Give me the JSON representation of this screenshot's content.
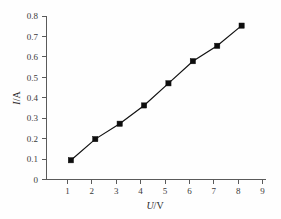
{
  "figure": {
    "background_color": "#fefefe",
    "axis_color": "#5a5a5a",
    "series_color": "#0d0d0d"
  },
  "axes": {
    "x_title_italic": "U",
    "x_title_rest": "/V",
    "y_title_italic": "I",
    "y_title_rest": "/A",
    "x_ticks": [
      "1",
      "2",
      "3",
      "4",
      "5",
      "6",
      "7",
      "8",
      "9"
    ],
    "y_ticks": [
      "0",
      "0.1",
      "0.2",
      "0.3",
      "0.4",
      "0.5",
      "0.6",
      "0.7",
      "0.8"
    ]
  },
  "chart_data": {
    "type": "scatter",
    "title": "",
    "subtitle": "",
    "xlabel": "U/V",
    "ylabel": "I/A",
    "xlim": [
      0,
      9
    ],
    "ylim": [
      0,
      0.85
    ],
    "grid": false,
    "legend": null,
    "x_tick_values": [
      1,
      2,
      3,
      4,
      5,
      6,
      7,
      8,
      9
    ],
    "y_tick_values": [
      0,
      0.1,
      0.2,
      0.3,
      0.4,
      0.5,
      0.6,
      0.7,
      0.8
    ],
    "series": [
      {
        "name": "I vs U",
        "marker": "filled-square",
        "line": "solid",
        "x": [
          1,
          2,
          3,
          4,
          5,
          6,
          7,
          8
        ],
        "y": [
          0.1,
          0.21,
          0.29,
          0.385,
          0.5,
          0.615,
          0.695,
          0.8
        ]
      }
    ],
    "annotations": []
  }
}
